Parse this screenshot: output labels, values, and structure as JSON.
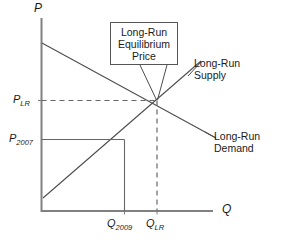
{
  "figure": {
    "type": "supply-demand-diagram",
    "axes": {
      "y_title": "P",
      "x_title": "Q",
      "y_ticks": [
        {
          "id": "p-lr",
          "base": "P",
          "sub": "LR",
          "text": "P_LR"
        },
        {
          "id": "p-2007",
          "base": "P",
          "sub": "2007",
          "text": "P_2007"
        }
      ],
      "x_ticks": [
        {
          "id": "q-2009",
          "base": "Q",
          "sub": "2009",
          "text": "Q_2009"
        },
        {
          "id": "q-lr",
          "base": "Q",
          "sub": "LR",
          "text": "Q_LR"
        }
      ]
    },
    "callout": {
      "lines": [
        "Long-Run",
        "Equilibrium",
        "Price"
      ]
    },
    "curves": [
      {
        "id": "supply",
        "lines": [
          "Long-Run",
          "Supply"
        ]
      },
      {
        "id": "demand",
        "lines": [
          "Long-Run",
          "Demand"
        ]
      }
    ],
    "colors": {
      "axis": "#808080",
      "curve": "#4d4d4d",
      "guide": "#666666",
      "text": "#1a1a1a",
      "box_border": "#555555"
    }
  }
}
